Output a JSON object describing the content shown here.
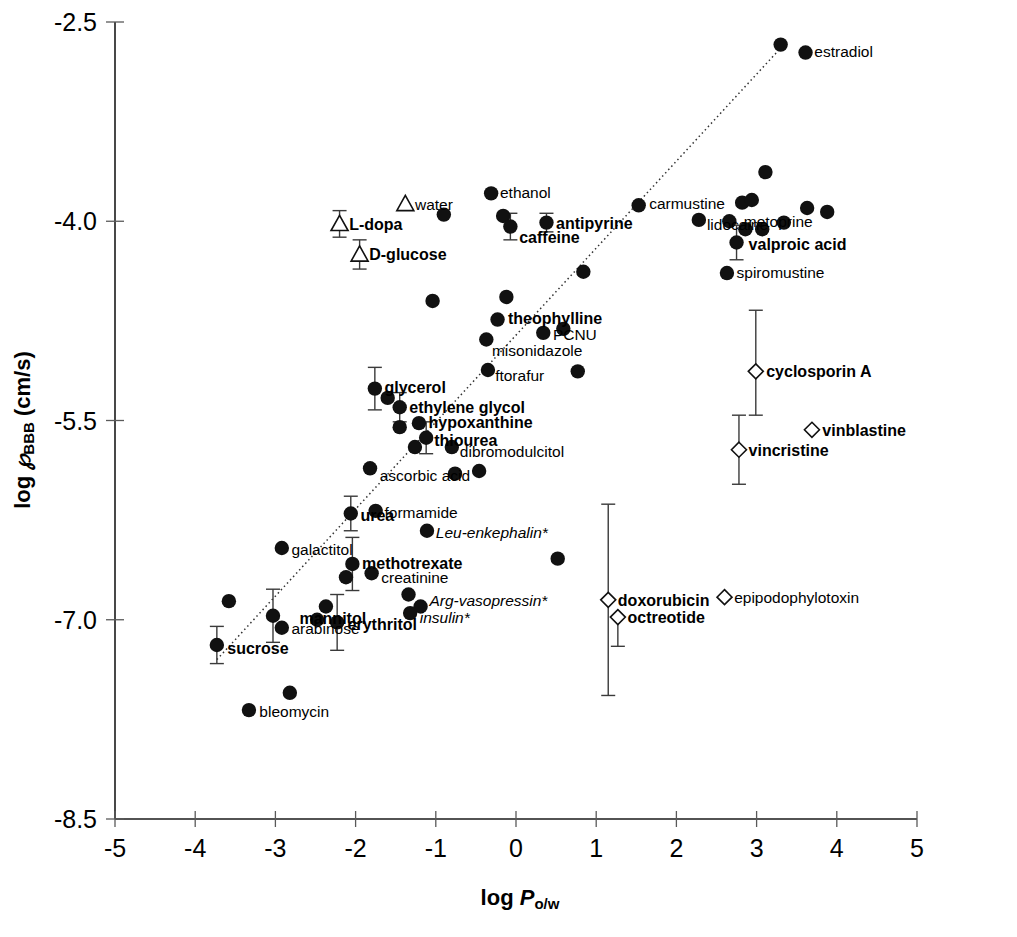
{
  "chart_data": {
    "type": "scatter",
    "title": "",
    "xlabel": "log P_o/w",
    "ylabel": "log P_BBB (cm/s)",
    "xlabel_parts": {
      "prefix": "log ",
      "italic": "P",
      "sub": "o/w"
    },
    "ylabel_parts": {
      "prefix": "log ",
      "italic": "℘",
      "sub": "BBB",
      "suffix": " (cm/s)"
    },
    "xlim": [
      -5,
      5
    ],
    "ylim": [
      -8.5,
      -2.5
    ],
    "xticks": [
      -5,
      -4,
      -3,
      -2,
      -1,
      0,
      1,
      2,
      3,
      4,
      5
    ],
    "xticklabels": [
      "-5",
      "-4",
      "-3",
      "-2",
      "-1",
      "0",
      "1",
      "2",
      "3",
      "4",
      "5"
    ],
    "yticks": [
      -2.5,
      -4.0,
      -5.5,
      -7.0,
      -8.5
    ],
    "yticklabels": [
      "-2.5",
      "-4.0",
      "-5.5",
      "-7.0",
      "-8.5"
    ],
    "grid": false,
    "legend": "none",
    "trendline": {
      "x0": -3.73,
      "y0": -7.32,
      "x1": -3.73,
      "y1": -7.32,
      "p0": [
        -3.73,
        -7.3
      ],
      "p1": [
        3.34,
        -2.67
      ]
    },
    "series": [
      {
        "name": "passive diffusion (filled circle)",
        "marker": "filled-circle",
        "points": [
          {
            "label": "estradiol",
            "bold": false,
            "italic": false,
            "x": 3.61,
            "y": -2.73,
            "lx": 3.72,
            "ly": -2.72,
            "anchor": "start",
            "err": null
          },
          {
            "label": "",
            "x": 3.3,
            "y": -2.67,
            "err": null
          },
          {
            "label": "ethanol",
            "bold": false,
            "x": -0.31,
            "y": -3.79,
            "lx": -0.2,
            "ly": -3.78,
            "anchor": "start",
            "err": null
          },
          {
            "label": "",
            "x": -0.16,
            "y": -3.96,
            "err": null
          },
          {
            "label": "",
            "x": 3.11,
            "y": -3.63,
            "err": null
          },
          {
            "label": "",
            "x": 2.82,
            "y": -3.86,
            "err": null
          },
          {
            "label": "",
            "x": 2.94,
            "y": -3.84,
            "err": null
          },
          {
            "label": "carmustine",
            "x": 1.53,
            "y": -3.88,
            "lx": 1.66,
            "ly": -3.86,
            "anchor": "start",
            "err": null
          },
          {
            "label": "",
            "x": -0.9,
            "y": -3.95,
            "err": null
          },
          {
            "label": "metoprine",
            "x": 3.63,
            "y": -3.9,
            "lx": 2.84,
            "ly": -4.0,
            "anchor": "start",
            "err": null
          },
          {
            "label": "",
            "x": 3.88,
            "y": -3.93,
            "err": null
          },
          {
            "label": "lidocaine",
            "x": 2.28,
            "y": -3.99,
            "lx": 2.38,
            "ly": -4.02,
            "anchor": "start",
            "err": null
          },
          {
            "label": "",
            "x": 2.66,
            "y": -4.0,
            "err": null
          },
          {
            "label": "",
            "x": 2.86,
            "y": -4.06,
            "err": null
          },
          {
            "label": "",
            "x": 3.07,
            "y": -4.06,
            "err": null
          },
          {
            "label": "",
            "x": 3.34,
            "y": -4.01,
            "err": null
          },
          {
            "label": "antipyrine",
            "bold": true,
            "x": 0.38,
            "y": -4.01,
            "lx": 0.5,
            "ly": -4.01,
            "anchor": "start",
            "err": [
              0.07,
              0.07
            ]
          },
          {
            "label": "caffeine",
            "bold": true,
            "x": -0.07,
            "y": -4.04,
            "lx": 0.04,
            "ly": -4.12,
            "anchor": "start",
            "err": [
              0.1,
              0.1
            ]
          },
          {
            "label": "valproic acid",
            "bold": true,
            "x": 2.75,
            "y": -4.16,
            "lx": 2.9,
            "ly": -4.17,
            "anchor": "start",
            "err": [
              0.13,
              0.13
            ]
          },
          {
            "label": "spiromustine",
            "x": 2.63,
            "y": -4.39,
            "lx": 2.75,
            "ly": -4.38,
            "anchor": "start",
            "err": null
          },
          {
            "label": "",
            "x": 0.84,
            "y": -4.38,
            "err": null
          },
          {
            "label": "",
            "x": -1.04,
            "y": -4.6,
            "err": null
          },
          {
            "label": "",
            "x": -0.12,
            "y": -4.57,
            "err": null
          },
          {
            "label": "theophylline",
            "bold": true,
            "x": -0.23,
            "y": -4.74,
            "lx": -0.1,
            "ly": -4.73,
            "anchor": "start",
            "err": null
          },
          {
            "label": "PCNU",
            "x": 0.34,
            "y": -4.84,
            "lx": 0.46,
            "ly": -4.85,
            "anchor": "start",
            "err": null
          },
          {
            "label": "misonidazole",
            "x": -0.37,
            "y": -4.89,
            "lx": -0.3,
            "ly": -4.97,
            "anchor": "start",
            "err": null
          },
          {
            "label": "ftorafur",
            "x": -0.35,
            "y": -5.12,
            "lx": -0.26,
            "ly": -5.16,
            "anchor": "start",
            "err": null
          },
          {
            "label": "",
            "x": 0.77,
            "y": -5.13,
            "err": null
          },
          {
            "label": "glycerol",
            "bold": true,
            "x": -1.76,
            "y": -5.26,
            "lx": -1.64,
            "ly": -5.25,
            "anchor": "start",
            "err": [
              0.16,
              0.16
            ]
          },
          {
            "label": "",
            "x": -1.6,
            "y": -5.33,
            "err": null
          },
          {
            "label": "ethylene glycol",
            "bold": true,
            "x": -1.45,
            "y": -5.4,
            "lx": -1.33,
            "ly": -5.4,
            "anchor": "start",
            "err": [
              0.11,
              0.11
            ]
          },
          {
            "label": "hypoxanthine",
            "bold": true,
            "x": -1.21,
            "y": -5.52,
            "lx": -1.09,
            "ly": -5.51,
            "anchor": "start",
            "err": null
          },
          {
            "label": "",
            "x": -1.45,
            "y": -5.55,
            "err": null
          },
          {
            "label": "thiourea",
            "bold": true,
            "x": -1.12,
            "y": -5.63,
            "lx": -1.02,
            "ly": -5.65,
            "anchor": "start",
            "err": [
              0.12,
              0.12
            ]
          },
          {
            "label": "dibromodulcitol",
            "x": -0.8,
            "y": -5.7,
            "lx": -0.7,
            "ly": -5.73,
            "anchor": "start",
            "err": null
          },
          {
            "label": "",
            "x": -1.26,
            "y": -5.7,
            "err": null
          },
          {
            "label": "",
            "x": -0.46,
            "y": -5.88,
            "err": null
          },
          {
            "label": "ascorbic acid",
            "x": -1.82,
            "y": -5.86,
            "lx": -1.7,
            "ly": -5.91,
            "anchor": "start",
            "err": null
          },
          {
            "label": "",
            "x": -0.76,
            "y": -5.9,
            "err": null
          },
          {
            "label": "urea",
            "bold": true,
            "x": -2.06,
            "y": -6.2,
            "lx": -1.94,
            "ly": -6.21,
            "anchor": "start",
            "err": [
              0.13,
              0.13
            ]
          },
          {
            "label": "formamide",
            "x": -1.75,
            "y": -6.18,
            "lx": -1.64,
            "ly": -6.19,
            "anchor": "start",
            "err": null
          },
          {
            "label": "Leu-enkephalin*",
            "italic": true,
            "x": -1.11,
            "y": -6.33,
            "lx": -1.0,
            "ly": -6.34,
            "anchor": "start",
            "err": null
          },
          {
            "label": "",
            "x": 0.52,
            "y": -6.54,
            "err": null
          },
          {
            "label": "galactitol",
            "x": -2.92,
            "y": -6.46,
            "lx": -2.8,
            "ly": -6.47,
            "anchor": "start",
            "err": null
          },
          {
            "label": "methotrexate",
            "bold": true,
            "x": -2.04,
            "y": -6.58,
            "lx": -1.92,
            "ly": -6.57,
            "anchor": "start",
            "err": [
              0.2,
              0.2
            ]
          },
          {
            "label": "creatinine",
            "x": -1.8,
            "y": -6.65,
            "lx": -1.68,
            "ly": -6.68,
            "anchor": "start",
            "err": null
          },
          {
            "label": "",
            "x": -2.12,
            "y": -6.68,
            "err": null
          },
          {
            "label": "",
            "x": -3.58,
            "y": -6.86,
            "err": null
          },
          {
            "label": "",
            "x": -1.34,
            "y": -6.81,
            "err": null
          },
          {
            "label": "Arg-vasopressin*",
            "italic": true,
            "x": -1.19,
            "y": -6.9,
            "lx": -1.08,
            "ly": -6.85,
            "anchor": "start",
            "err": null
          },
          {
            "label": "insulin*",
            "italic": true,
            "x": -1.32,
            "y": -6.95,
            "lx": -1.2,
            "ly": -6.98,
            "anchor": "start",
            "err": null
          },
          {
            "label": "mannitol",
            "bold": true,
            "x": -3.03,
            "y": -6.97,
            "lx": -2.7,
            "ly": -6.99,
            "anchor": "start",
            "err": [
              0.2,
              0.2
            ]
          },
          {
            "label": "",
            "x": -2.37,
            "y": -6.9,
            "err": null
          },
          {
            "label": "erythritol",
            "bold": true,
            "x": -2.23,
            "y": -7.02,
            "lx": -2.1,
            "ly": -7.03,
            "anchor": "start",
            "err": [
              0.21,
              0.21
            ]
          },
          {
            "label": "",
            "x": -2.48,
            "y": -7.0,
            "err": null
          },
          {
            "label": "arabinose",
            "x": -2.92,
            "y": -7.06,
            "lx": -2.8,
            "ly": -7.06,
            "anchor": "start",
            "err": null
          },
          {
            "label": "sucrose",
            "bold": true,
            "x": -3.73,
            "y": -7.19,
            "lx": -3.6,
            "ly": -7.21,
            "anchor": "start",
            "err": [
              0.14,
              0.14
            ]
          },
          {
            "label": "",
            "x": -2.82,
            "y": -7.55,
            "err": null
          },
          {
            "label": "bleomycin",
            "x": -3.33,
            "y": -7.68,
            "lx": -3.2,
            "ly": -7.69,
            "anchor": "start",
            "err": null
          },
          {
            "label": "",
            "x": 0.59,
            "y": -4.81,
            "err": null
          }
        ]
      },
      {
        "name": "carrier-mediated transport (open triangle)",
        "marker": "open-triangle",
        "points": [
          {
            "label": "water",
            "x": -1.38,
            "y": -3.87,
            "lx": -1.26,
            "ly": -3.87,
            "anchor": "start",
            "err": null
          },
          {
            "label": "L-dopa",
            "bold": true,
            "x": -2.2,
            "y": -4.02,
            "lx": -2.08,
            "ly": -4.02,
            "anchor": "start",
            "err": [
              0.1,
              0.1
            ]
          },
          {
            "label": "D-glucose",
            "bold": true,
            "x": -1.95,
            "y": -4.25,
            "lx": -1.83,
            "ly": -4.25,
            "anchor": "start",
            "err": [
              0.11,
              0.11
            ]
          }
        ]
      },
      {
        "name": "efflux / P-gp substrate (open diamond)",
        "marker": "open-diamond",
        "points": [
          {
            "label": "cyclosporin A",
            "bold": true,
            "x": 2.99,
            "y": -5.13,
            "lx": 3.12,
            "ly": -5.13,
            "anchor": "start",
            "err": [
              0.46,
              0.33
            ]
          },
          {
            "label": "vinblastine",
            "bold": true,
            "x": 3.69,
            "y": -5.57,
            "lx": 3.82,
            "ly": -5.57,
            "anchor": "start",
            "err": null
          },
          {
            "label": "vincristine",
            "bold": true,
            "x": 2.78,
            "y": -5.72,
            "lx": 2.9,
            "ly": -5.72,
            "anchor": "start",
            "err": [
              0.26,
              0.26
            ]
          },
          {
            "label": "doxorubicin",
            "bold": true,
            "x": 1.15,
            "y": -6.85,
            "lx": 1.27,
            "ly": -6.85,
            "anchor": "start",
            "err": [
              0.72,
              0.72
            ]
          },
          {
            "label": "octreotide",
            "bold": true,
            "x": 1.27,
            "y": -6.98,
            "lx": 1.39,
            "ly": -6.98,
            "anchor": "start",
            "err": [
              0.0,
              0.22
            ]
          },
          {
            "label": "epipodophylotoxin",
            "x": 2.6,
            "y": -6.83,
            "lx": 2.72,
            "ly": -6.83,
            "anchor": "start",
            "err": null
          }
        ]
      }
    ]
  },
  "colors": {
    "marker_fill": "#111111",
    "axis": "#1a1a1a",
    "trend": "#333333",
    "background": "#ffffff"
  }
}
